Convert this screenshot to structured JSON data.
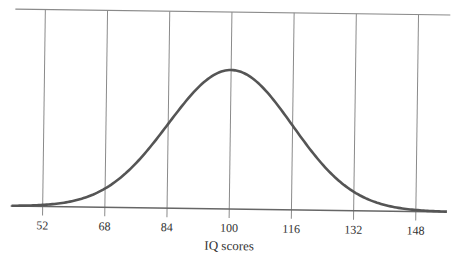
{
  "chart_data": {
    "type": "line",
    "title": "",
    "xlabel": "IQ scores",
    "ylabel": "",
    "x_ticks": [
      52,
      68,
      84,
      100,
      116,
      132,
      148
    ],
    "xlim": [
      44,
      156
    ],
    "grid": {
      "vertical": true,
      "horizontal": false
    },
    "legend": null,
    "series": [
      {
        "name": "Normal distribution of IQ scores",
        "distribution": "normal",
        "mean": 100,
        "std_dev": 16,
        "x": [
          52,
          60,
          68,
          76,
          84,
          92,
          100,
          108,
          116,
          124,
          132,
          140,
          148
        ],
        "y_relative": [
          0.011,
          0.044,
          0.135,
          0.325,
          0.607,
          0.882,
          1.0,
          0.882,
          0.607,
          0.325,
          0.135,
          0.044,
          0.011
        ]
      }
    ]
  },
  "colors": {
    "curve": "#555555",
    "grid": "#8a8a8a",
    "axis": "#555555",
    "text": "#333333"
  }
}
